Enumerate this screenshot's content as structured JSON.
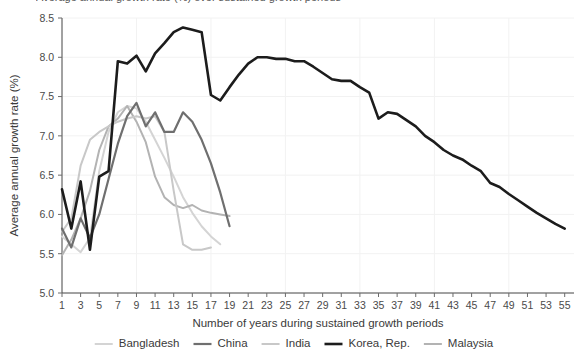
{
  "axes": {
    "ylabel": "Average annual growth rate (%)",
    "xlabel": "Number of years during sustained growth periods",
    "y_ticks": [
      "5.0",
      "5.5",
      "6.0",
      "6.5",
      "7.0",
      "7.5",
      "8.0",
      "8.5"
    ],
    "x_ticks": [
      "1",
      "3",
      "5",
      "7",
      "9",
      "11",
      "13",
      "15",
      "17",
      "19",
      "21",
      "23",
      "25",
      "27",
      "29",
      "31",
      "33",
      "35",
      "37",
      "39",
      "41",
      "43",
      "45",
      "47",
      "49",
      "51",
      "53",
      "55"
    ]
  },
  "partial_title": "Average annual growth rate (%) over sustained growth periods",
  "legend": {
    "position": "bottom",
    "items": [
      {
        "label": "Bangladesh",
        "color": "#d4d4d4",
        "width": 2.0
      },
      {
        "label": "China",
        "color": "#6f6f6f",
        "width": 2.2
      },
      {
        "label": "India",
        "color": "#c8c8c8",
        "width": 2.0
      },
      {
        "label": "Korea, Rep.",
        "color": "#1c1c1c",
        "width": 2.6
      },
      {
        "label": "Malaysia",
        "color": "#b3b3b3",
        "width": 2.0
      }
    ]
  },
  "chart_data": {
    "type": "line",
    "title": "Average annual growth rate (%) over sustained growth periods",
    "xlabel": "Number of years during sustained growth periods",
    "ylabel": "Average annual growth rate (%)",
    "xlim": [
      1,
      56
    ],
    "ylim": [
      5.0,
      8.5
    ],
    "grid": true,
    "legend_position": "bottom",
    "x_tick_step": 2,
    "y_tick_step": 0.5,
    "series": [
      {
        "name": "Bangladesh",
        "color": "#d4d4d4",
        "x": [
          1,
          2,
          3,
          4,
          5,
          6,
          7,
          8,
          9,
          10,
          11,
          12,
          13,
          14,
          15,
          16,
          17,
          18
        ],
        "y": [
          5.72,
          5.62,
          5.52,
          5.7,
          6.55,
          7.05,
          7.3,
          7.38,
          7.35,
          7.18,
          6.95,
          6.72,
          6.48,
          6.22,
          6.02,
          5.85,
          5.72,
          5.62
        ]
      },
      {
        "name": "China",
        "color": "#6f6f6f",
        "x": [
          1,
          2,
          3,
          4,
          5,
          6,
          7,
          8,
          9,
          10,
          11,
          12,
          13,
          14,
          15,
          16,
          17,
          18,
          19
        ],
        "y": [
          5.82,
          5.58,
          5.95,
          5.7,
          6.0,
          6.45,
          6.9,
          7.25,
          7.42,
          7.12,
          7.3,
          7.05,
          7.05,
          7.3,
          7.18,
          6.95,
          6.65,
          6.28,
          5.85
        ]
      },
      {
        "name": "India",
        "color": "#c8c8c8",
        "x": [
          1,
          2,
          3,
          4,
          5,
          6,
          7,
          8,
          9,
          10,
          11,
          12,
          13,
          14,
          15,
          16,
          17
        ],
        "y": [
          5.78,
          5.95,
          6.62,
          6.95,
          7.05,
          7.12,
          7.18,
          7.22,
          7.25,
          7.22,
          7.25,
          7.05,
          6.3,
          5.62,
          5.55,
          5.55,
          5.58
        ]
      },
      {
        "name": "Korea, Rep.",
        "color": "#1c1c1c",
        "x": [
          1,
          2,
          3,
          4,
          5,
          6,
          7,
          8,
          9,
          10,
          11,
          12,
          13,
          14,
          15,
          16,
          17,
          18,
          19,
          20,
          21,
          22,
          23,
          24,
          25,
          26,
          27,
          28,
          29,
          30,
          31,
          32,
          33,
          34,
          35,
          36,
          37,
          38,
          39,
          40,
          41,
          42,
          43,
          44,
          45,
          46,
          47,
          48,
          49,
          50,
          51,
          52,
          53,
          54,
          55
        ],
        "y": [
          6.32,
          5.82,
          6.42,
          5.55,
          6.48,
          6.55,
          7.95,
          7.92,
          8.02,
          7.82,
          8.05,
          8.18,
          8.32,
          8.38,
          8.35,
          8.32,
          7.52,
          7.45,
          7.62,
          7.78,
          7.92,
          8.0,
          8.0,
          7.98,
          7.98,
          7.95,
          7.95,
          7.88,
          7.8,
          7.72,
          7.7,
          7.7,
          7.62,
          7.55,
          7.22,
          7.3,
          7.28,
          7.2,
          7.12,
          7.0,
          6.92,
          6.82,
          6.75,
          6.7,
          6.62,
          6.55,
          6.4,
          6.35,
          6.26,
          6.18,
          6.1,
          6.02,
          5.95,
          5.88,
          5.82
        ]
      },
      {
        "name": "Malaysia",
        "color": "#b3b3b3",
        "x": [
          1,
          2,
          3,
          4,
          5,
          6,
          7,
          8,
          9,
          10,
          11,
          12,
          13,
          14,
          15,
          16,
          17,
          18,
          19
        ],
        "y": [
          5.48,
          5.68,
          5.95,
          6.3,
          6.82,
          7.12,
          7.22,
          7.38,
          7.18,
          6.92,
          6.48,
          6.22,
          6.12,
          6.08,
          6.12,
          6.05,
          6.02,
          6.0,
          5.98
        ]
      }
    ]
  }
}
